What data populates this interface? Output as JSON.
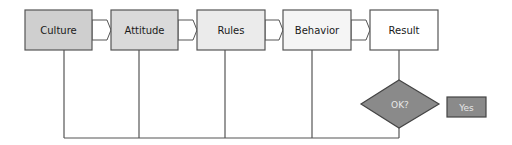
{
  "diagram": {
    "stages": [
      {
        "id": "culture",
        "label": "Culture",
        "fill": "#cfcfcf"
      },
      {
        "id": "attitude",
        "label": "Attitude",
        "fill": "#dadada"
      },
      {
        "id": "rules",
        "label": "Rules",
        "fill": "#ebebeb"
      },
      {
        "id": "behavior",
        "label": "Behavior",
        "fill": "#f5f5f5"
      },
      {
        "id": "result",
        "label": "Result",
        "fill": "#ffffff"
      }
    ],
    "decision": {
      "label": "OK?",
      "fill": "#8a8a8a"
    },
    "yes_box": {
      "label": "Yes",
      "fill": "#8a8a8a"
    },
    "line_color": "#555555",
    "feedback_loop_targets": [
      "culture",
      "attitude",
      "rules",
      "behavior"
    ]
  }
}
